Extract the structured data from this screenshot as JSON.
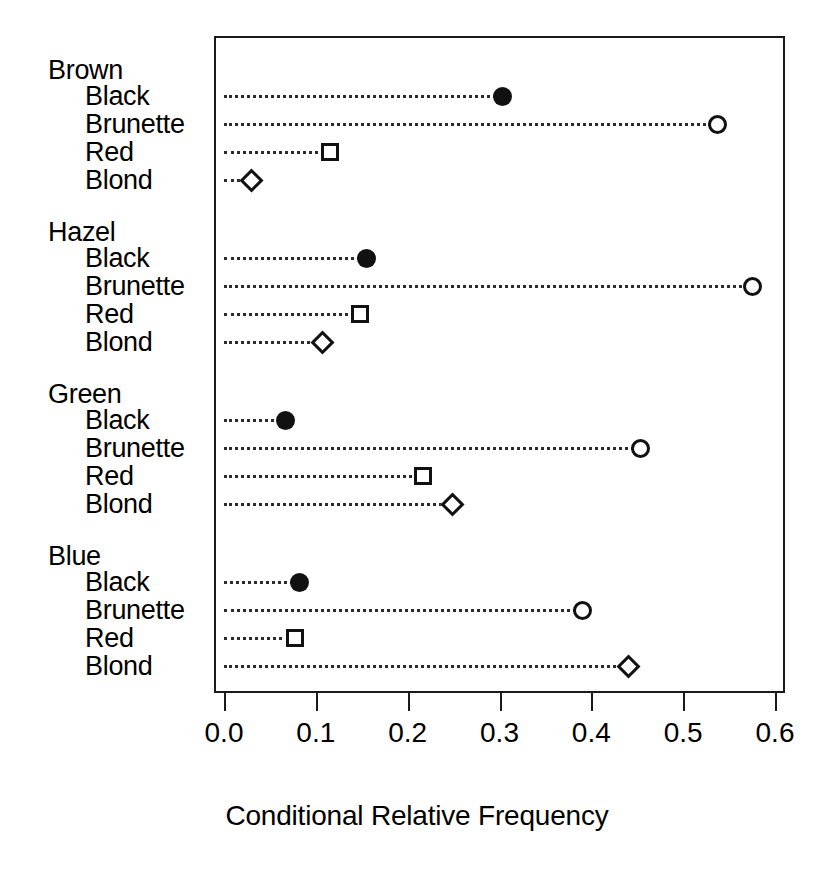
{
  "chart_data": {
    "type": "scatter",
    "title": "",
    "xlabel": "Conditional Relative Frequency",
    "ylabel": "",
    "xlim": [
      0.0,
      0.6
    ],
    "xticks": [
      "0.0",
      "0.1",
      "0.2",
      "0.3",
      "0.4",
      "0.5",
      "0.6"
    ],
    "xtick_values": [
      0.0,
      0.1,
      0.2,
      0.3,
      0.4,
      0.5,
      0.6
    ],
    "grid": false,
    "legend": "none",
    "orientation": "horizontal",
    "categories": [
      "Black",
      "Brunette",
      "Red",
      "Blond"
    ],
    "groups": [
      {
        "name": "Brown",
        "rows": [
          {
            "label": "Black",
            "value": 0.303,
            "marker": "filled-circle"
          },
          {
            "label": "Brunette",
            "value": 0.537,
            "marker": "open-circle"
          },
          {
            "label": "Red",
            "value": 0.115,
            "marker": "open-square"
          },
          {
            "label": "Blond",
            "value": 0.03,
            "marker": "open-diamond"
          }
        ]
      },
      {
        "name": "Hazel",
        "rows": [
          {
            "label": "Black",
            "value": 0.155,
            "marker": "filled-circle"
          },
          {
            "label": "Brunette",
            "value": 0.576,
            "marker": "open-circle"
          },
          {
            "label": "Red",
            "value": 0.148,
            "marker": "open-square"
          },
          {
            "label": "Blond",
            "value": 0.107,
            "marker": "open-diamond"
          }
        ]
      },
      {
        "name": "Green",
        "rows": [
          {
            "label": "Black",
            "value": 0.067,
            "marker": "filled-circle"
          },
          {
            "label": "Brunette",
            "value": 0.453,
            "marker": "open-circle"
          },
          {
            "label": "Red",
            "value": 0.217,
            "marker": "open-square"
          },
          {
            "label": "Blond",
            "value": 0.249,
            "marker": "open-diamond"
          }
        ]
      },
      {
        "name": "Blue",
        "rows": [
          {
            "label": "Black",
            "value": 0.082,
            "marker": "filled-circle"
          },
          {
            "label": "Brunette",
            "value": 0.39,
            "marker": "open-circle"
          },
          {
            "label": "Red",
            "value": 0.077,
            "marker": "open-square"
          },
          {
            "label": "Blond",
            "value": 0.44,
            "marker": "open-diamond"
          }
        ]
      }
    ]
  },
  "colors": {
    "ink": "#111111",
    "frame": "#1a1a1a",
    "background": "#ffffff"
  }
}
